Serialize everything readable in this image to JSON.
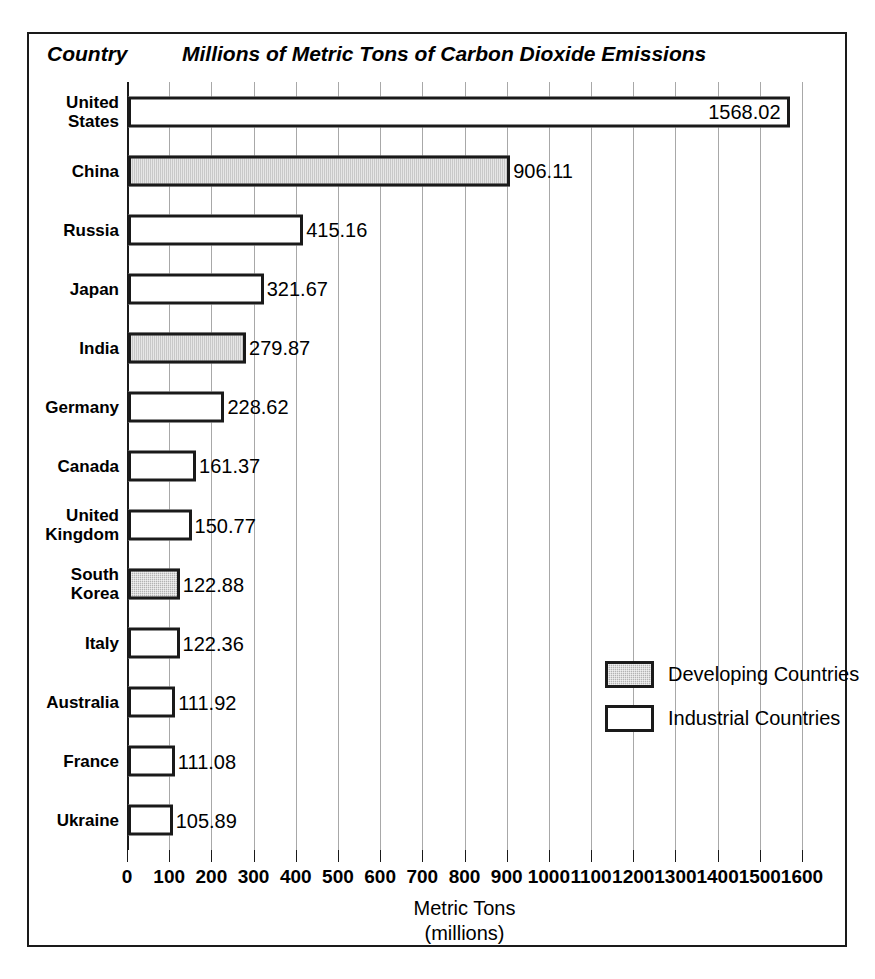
{
  "header": {
    "country_header": "Country",
    "title": "Millions of Metric Tons of Carbon Dioxide Emissions"
  },
  "axis": {
    "title_line1": "Metric Tons",
    "title_line2": "(millions)"
  },
  "legend": {
    "items": [
      {
        "label": "Developing Countries",
        "swatch": "developing"
      },
      {
        "label": "Industrial Countries",
        "swatch": "industrial"
      }
    ]
  },
  "chart_data": {
    "type": "bar",
    "orientation": "horizontal",
    "title": "Millions of Metric Tons of Carbon Dioxide Emissions",
    "xlabel": "Metric Tons (millions)",
    "ylabel": "Country",
    "xlim": [
      0,
      1600
    ],
    "xticks": [
      0,
      100,
      200,
      300,
      400,
      500,
      600,
      700,
      800,
      900,
      1000,
      1100,
      1200,
      1300,
      1400,
      1500,
      1600
    ],
    "xtick_labels": [
      "0",
      "100",
      "200",
      "300",
      "400",
      "500",
      "600",
      "700",
      "800",
      "900",
      "1000",
      "1100",
      "1200",
      "1300",
      "1400",
      "1500",
      "1600"
    ],
    "grid": true,
    "legend_position": "inside-right",
    "categories": [
      "United States",
      "China",
      "Russia",
      "Japan",
      "India",
      "Germany",
      "Canada",
      "United Kingdom",
      "South Korea",
      "Italy",
      "Australia",
      "France",
      "Ukraine"
    ],
    "values": [
      1568.02,
      906.11,
      415.16,
      321.67,
      279.87,
      228.62,
      161.37,
      150.77,
      122.88,
      122.36,
      111.92,
      111.08,
      105.89
    ],
    "value_labels": [
      "1568.02",
      "906.11",
      "415.16",
      "321.67",
      "279.87",
      "228.62",
      "161.37",
      "150.77",
      "122.88",
      "122.36",
      "111.92",
      "111.08",
      "105.89"
    ],
    "groups": [
      "industrial",
      "developing",
      "industrial",
      "industrial",
      "developing",
      "industrial",
      "industrial",
      "industrial",
      "developing",
      "industrial",
      "industrial",
      "industrial",
      "industrial"
    ],
    "label_placement": [
      "inside",
      "outside",
      "outside",
      "outside",
      "outside",
      "outside",
      "outside",
      "outside",
      "outside",
      "outside",
      "outside",
      "outside",
      "outside"
    ],
    "category_label_lines": [
      [
        "United",
        "States"
      ],
      [
        "China"
      ],
      [
        "Russia"
      ],
      [
        "Japan"
      ],
      [
        "India"
      ],
      [
        "Germany"
      ],
      [
        "Canada"
      ],
      [
        "United",
        "Kingdom"
      ],
      [
        "South",
        "Korea"
      ],
      [
        "Italy"
      ],
      [
        "Australia"
      ],
      [
        "France"
      ],
      [
        "Ukraine"
      ]
    ],
    "series": [
      {
        "name": "Developing Countries",
        "color": "#b3b3b3"
      },
      {
        "name": "Industrial Countries",
        "color": "#ffffff"
      }
    ]
  }
}
